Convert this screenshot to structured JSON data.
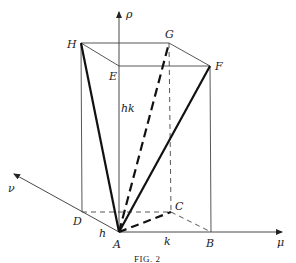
{
  "figure": {
    "caption": "Fig. 2",
    "caption_display": "FIG. 2",
    "axes": {
      "rho": "ρ",
      "mu": "μ",
      "nu": "ν"
    },
    "vertices": {
      "A": "A",
      "B": "B",
      "C": "C",
      "D": "D",
      "E": "E",
      "F": "F",
      "G": "G",
      "H": "H"
    },
    "dimension_labels": {
      "h": "h",
      "k": "k",
      "hk": "hk"
    },
    "edges": {
      "solid_thick": [
        "AH",
        "AF"
      ],
      "dashed_thick": [
        "AG",
        "AC"
      ],
      "dashed_thin": [
        "DC",
        "CB",
        "CG"
      ],
      "solid_thin": [
        "HE",
        "EF",
        "HG",
        "GF",
        "HD",
        "FB",
        "AB",
        "AD"
      ]
    }
  }
}
